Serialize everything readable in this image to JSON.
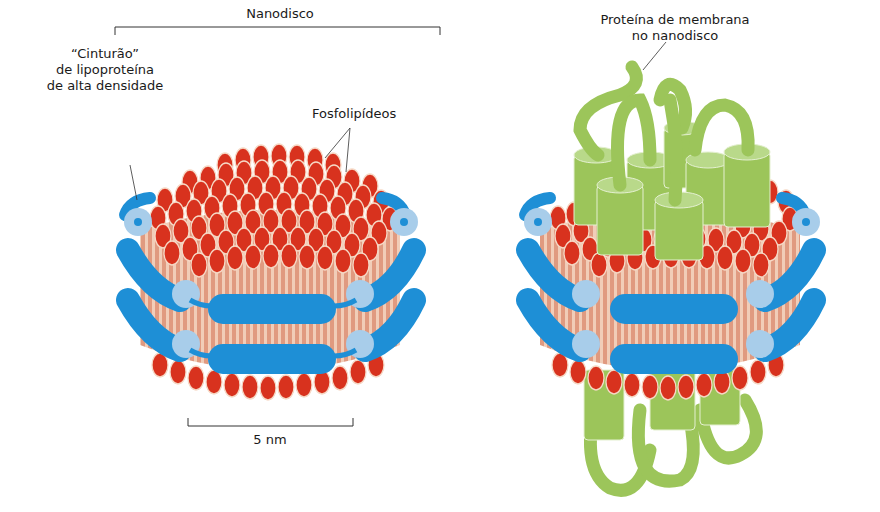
{
  "left_panel": {
    "bracket_label": "Nanodisco",
    "belt_label_lines": [
      "“Cinturão”",
      "de lipoproteína",
      "de alta densidade"
    ],
    "phospholipid_label": "Fosfolipídeos",
    "scale_bar_label": "5 nm"
  },
  "right_panel": {
    "protein_label_lines": [
      "Proteína de membrana",
      "no nanodisco"
    ]
  },
  "colors": {
    "lipid_head": "#d8321e",
    "lipid_tail": "#e8a48c",
    "belt_blue": "#1e8fd6",
    "belt_light_blue": "#a8cdea",
    "protein_green": "#9cc55a",
    "protein_light_green": "#b9d98a",
    "text": "#1a1a1a"
  }
}
